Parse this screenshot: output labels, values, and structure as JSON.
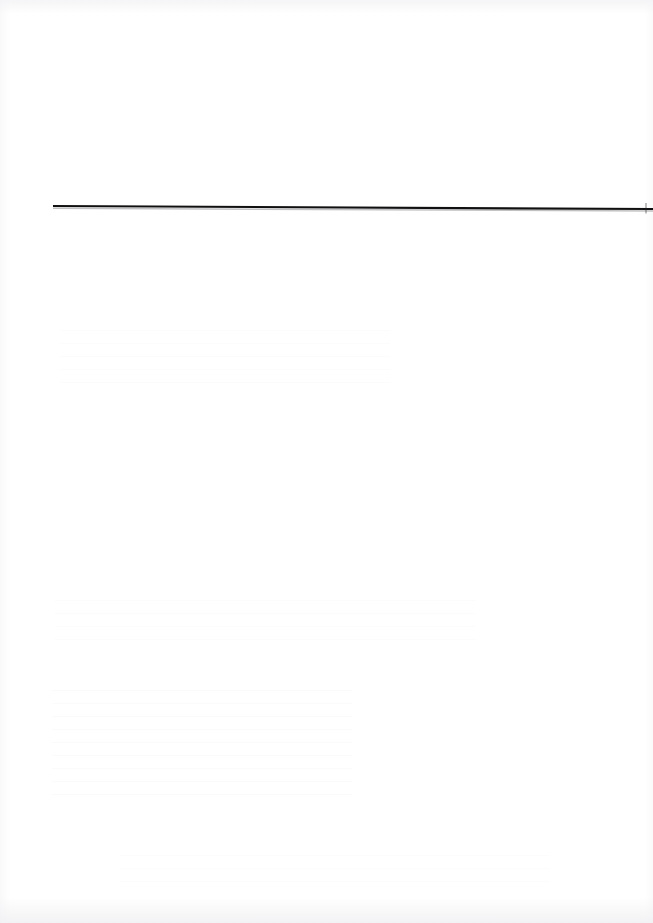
{
  "page": {
    "kind": "scanned-document-page",
    "label": "Scanned page",
    "width": 653,
    "height": 923,
    "background_color": "#ffffff",
    "content_text": "",
    "content_note": "Blank page — no legible text is rendered in the pixels."
  },
  "rule": {
    "label": "Horizontal rule",
    "color": "#101010",
    "shadow_color": "#8f8f93",
    "x_start": 53,
    "y_start": 206,
    "x_end": 653,
    "y_end": 209,
    "thickness": 2.2
  },
  "artifacts": {
    "paper_tone_label": "Paper edge shading",
    "ghost_label": "Faint reverse-side show-through",
    "blocks": [
      {
        "id": "ghost-upper",
        "label": "Show-through block upper"
      },
      {
        "id": "ghost-mid",
        "label": "Show-through block middle"
      },
      {
        "id": "ghost-lower",
        "label": "Show-through block lower"
      },
      {
        "id": "ghost-foot",
        "label": "Show-through block footer"
      }
    ]
  }
}
